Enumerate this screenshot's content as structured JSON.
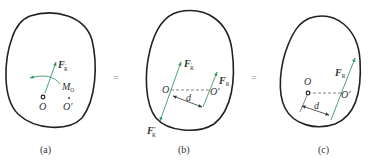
{
  "figure": {
    "panels": [
      {
        "id": "a",
        "caption": "(a)",
        "labels": {
          "force": "F",
          "force_sub": "R",
          "force_prime": "′",
          "moment": "M",
          "moment_sub": "O",
          "point_o": "O",
          "point_o_prime": "O′"
        }
      },
      {
        "id": "b",
        "caption": "(b)",
        "labels": {
          "force_up": "F",
          "force_up_sub": "R",
          "force_up_prime": "′",
          "force_down": "F",
          "force_down_sub": "R",
          "force_down_prime": "″",
          "force_right": "F",
          "force_right_sub": "R",
          "point_o": "O",
          "point_o_prime": "O′",
          "distance": "d"
        }
      },
      {
        "id": "c",
        "caption": "(c)",
        "labels": {
          "force": "F",
          "force_sub": "R",
          "point_o": "O",
          "point_o_prime": "O′",
          "distance": "d"
        }
      }
    ],
    "equals": [
      "=",
      "="
    ],
    "colors": {
      "outline": "#222222",
      "force_arrow": "#3a9a6a",
      "line": "#555555",
      "dashed": "#666666"
    }
  }
}
